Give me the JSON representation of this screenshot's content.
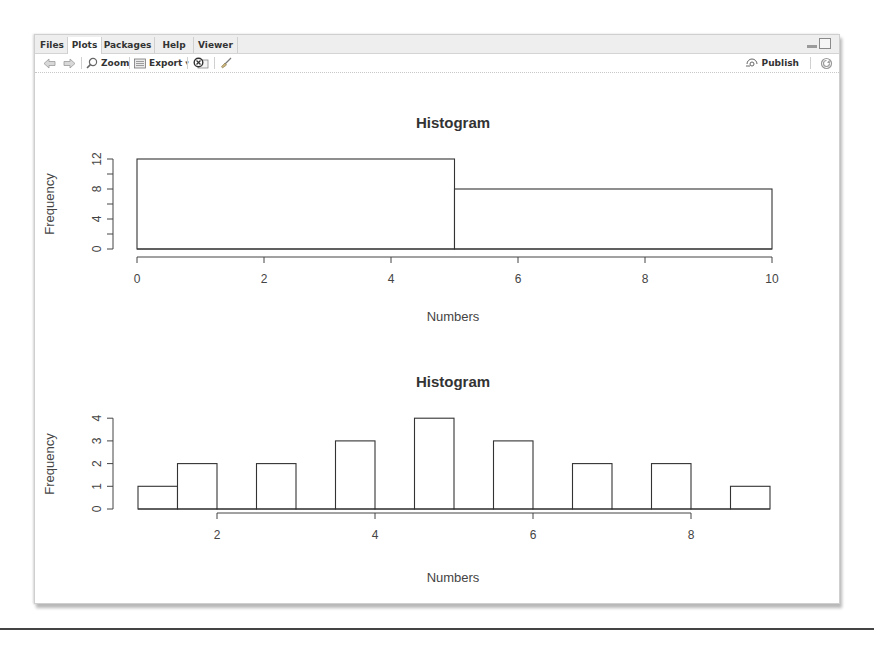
{
  "window": {
    "tabs": [
      {
        "label": "Files",
        "active": false
      },
      {
        "label": "Plots",
        "active": true
      },
      {
        "label": "Packages",
        "active": false
      },
      {
        "label": "Help",
        "active": false
      },
      {
        "label": "Viewer",
        "active": false
      }
    ],
    "controls": {
      "minimize": "minimize-icon",
      "maximize": "maximize-icon"
    }
  },
  "toolbar": {
    "back_icon": "arrow-left-icon",
    "forward_icon": "arrow-right-icon",
    "zoom_label": "Zoom",
    "export_label": "Export",
    "export_caret": "▾",
    "remove_icon": "remove-plot-icon",
    "clear_icon": "broom-icon",
    "publish_label": "Publish",
    "refresh_icon": "refresh-icon"
  },
  "colors": {
    "axis": "#444444",
    "bar_stroke": "#333333",
    "bar_fill": "#ffffff",
    "text": "#333333"
  },
  "chart_data": [
    {
      "type": "bar",
      "title": "Histogram",
      "xlabel": "Numbers",
      "ylabel": "Frequency",
      "bins": [
        [
          0,
          5
        ],
        [
          5,
          10
        ]
      ],
      "values": [
        12,
        8
      ],
      "xlim": [
        0,
        10
      ],
      "ylim": [
        0,
        12
      ],
      "xticks": [
        "0",
        "2",
        "4",
        "6",
        "8",
        "10"
      ],
      "yticks": [
        "0",
        "4",
        "8",
        "12"
      ],
      "grid": false
    },
    {
      "type": "bar",
      "title": "Histogram",
      "xlabel": "Numbers",
      "ylabel": "Frequency",
      "bins": [
        [
          1,
          1.5
        ],
        [
          1.5,
          2
        ],
        [
          2,
          2.5
        ],
        [
          2.5,
          3
        ],
        [
          3,
          3.5
        ],
        [
          3.5,
          4
        ],
        [
          4,
          4.5
        ],
        [
          4.5,
          5
        ],
        [
          5,
          5.5
        ],
        [
          5.5,
          6
        ],
        [
          6,
          6.5
        ],
        [
          6.5,
          7
        ],
        [
          7,
          7.5
        ],
        [
          7.5,
          8
        ],
        [
          8,
          8.5
        ],
        [
          8.5,
          9
        ]
      ],
      "values": [
        1,
        2,
        0,
        2,
        0,
        3,
        0,
        4,
        0,
        3,
        0,
        2,
        0,
        2,
        0,
        1
      ],
      "xlim": [
        1,
        9
      ],
      "ylim": [
        0,
        4
      ],
      "xticks": [
        "2",
        "4",
        "6",
        "8"
      ],
      "yticks": [
        "0",
        "1",
        "2",
        "3",
        "4"
      ],
      "grid": false
    }
  ]
}
